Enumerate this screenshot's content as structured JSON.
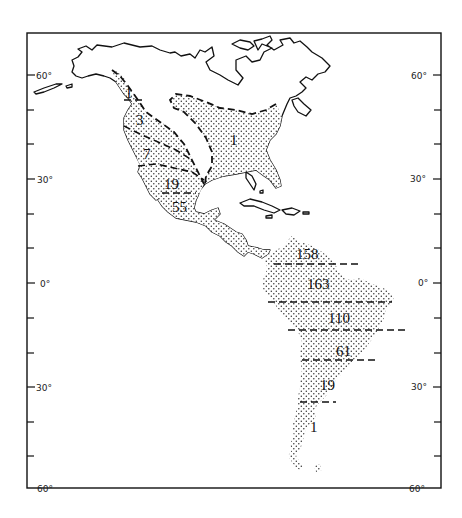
{
  "map": {
    "type": "thematic-distribution-map",
    "region": "The Americas",
    "pattern": "stippled",
    "latitude_axis": {
      "left_labels": [
        {
          "text": "60°",
          "lat": 60
        },
        {
          "text": "30°",
          "lat": 30
        },
        {
          "text": "0°",
          "lat": 0
        },
        {
          "text": "30°",
          "lat": -30
        },
        {
          "text": "60°",
          "lat": -60
        }
      ],
      "right_labels": [
        {
          "text": "60°",
          "lat": 60
        },
        {
          "text": "30°",
          "lat": 30
        },
        {
          "text": "0°",
          "lat": 0
        },
        {
          "text": "30°",
          "lat": -30
        },
        {
          "text": "60°",
          "lat": -60
        }
      ],
      "tick_interval_deg": 15
    },
    "north_america": {
      "zones": [
        {
          "label": "1",
          "area": "Pacific Northwest coast (Alaska panhandle / BC)"
        },
        {
          "label": "3",
          "area": "Western Canada / Pacific Northwest"
        },
        {
          "label": "7",
          "area": "Western United States"
        },
        {
          "label": "19",
          "area": "Northern Mexico / US Southwest"
        },
        {
          "label": "55",
          "area": "Central Mexico"
        },
        {
          "label": "1",
          "area": "Eastern North America"
        }
      ]
    },
    "south_america": {
      "zones": [
        {
          "label": "158",
          "area": "Northern South America"
        },
        {
          "label": "163",
          "area": "Equatorial band"
        },
        {
          "label": "110",
          "area": "Southern Amazon band"
        },
        {
          "label": "61",
          "area": "Central band"
        },
        {
          "label": "19",
          "area": "Southern temperate band"
        },
        {
          "label": "1",
          "area": "Patagonia"
        }
      ]
    }
  }
}
